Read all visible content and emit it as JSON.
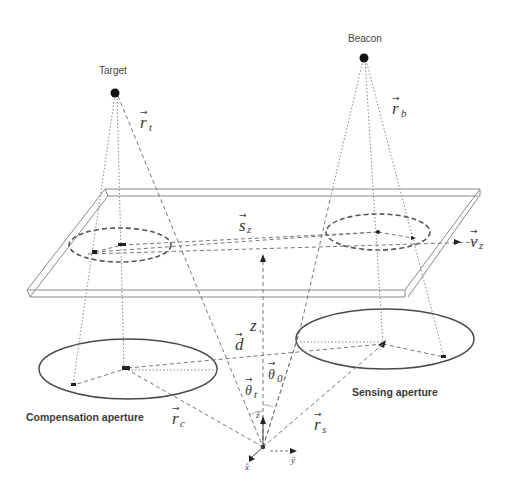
{
  "figure": {
    "points": {
      "target": {
        "label": "Target",
        "vector": "r",
        "vector_sub": "t"
      },
      "beacon": {
        "label": "Beacon",
        "vector": "r",
        "vector_sub": "b"
      }
    },
    "plate": {
      "separation_vector": "s",
      "separation_sub": "z",
      "velocity_vector": "v",
      "velocity_sub": "z",
      "height_label": "z",
      "height_suffix": ","
    },
    "apertures": {
      "compensation": {
        "label": "Compensation aperture",
        "vector": "r",
        "vector_sub": "c"
      },
      "sensing": {
        "label": "Sensing aperture",
        "vector": "r",
        "vector_sub": "s"
      }
    },
    "baseline": {
      "vector": "d"
    },
    "angles": {
      "theta_t": {
        "symbol": "θ",
        "sub": "t"
      },
      "theta_0": {
        "symbol": "θ",
        "sub": "0"
      }
    },
    "axes": {
      "z": "ẑ",
      "x": "x̂",
      "y": "ŷ"
    },
    "vector_arrow": "→",
    "colors": {
      "line": "#777777",
      "text": "#3a3a3a",
      "point": "#111111",
      "background": "#ffffff"
    }
  }
}
